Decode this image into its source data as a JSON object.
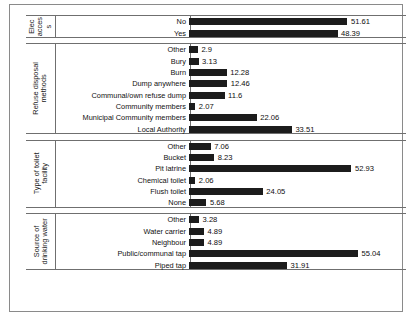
{
  "chart_data": {
    "type": "bar",
    "orientation": "horizontal",
    "title": "",
    "subtitle": "",
    "xlabel": "",
    "ylabel": "",
    "xlim": [
      0,
      60
    ],
    "grid": false,
    "legend": null,
    "value_labels": true,
    "bar_color": "#1c1c1c",
    "groups": [
      {
        "name": "Electricity access",
        "name_lines": [
          "Elec",
          "acces",
          "s"
        ],
        "categories": [
          "No",
          "Yes"
        ],
        "values": [
          51.61,
          48.39
        ],
        "labels": [
          "51.61",
          "48.39"
        ]
      },
      {
        "name": "Refuse disposal methods",
        "name_lines": [
          "Refuse disposal",
          "methods"
        ],
        "categories": [
          "Other",
          "Bury",
          "Burn",
          "Dump anywhere",
          "Communal/own refuse dump",
          "Community members",
          "Municipal Community members",
          "Local Authority"
        ],
        "values": [
          2.9,
          3.13,
          12.28,
          12.46,
          11.6,
          2.07,
          22.06,
          33.51
        ],
        "labels": [
          "2.9",
          "3.13",
          "12.28",
          "12.46",
          "11.6",
          "2.07",
          "22.06",
          "33.51"
        ]
      },
      {
        "name": "Type of toilet facility",
        "name_lines": [
          "Type of toilet",
          "facility"
        ],
        "categories": [
          "Other",
          "Bucket",
          "Pit latrine",
          "Chemical toilet",
          "Flush toilet",
          "None"
        ],
        "values": [
          7.06,
          8.23,
          52.93,
          2.06,
          24.05,
          5.68
        ],
        "labels": [
          "7.06",
          "8.23",
          "52.93",
          "2.06",
          "24.05",
          "5.68"
        ]
      },
      {
        "name": "Source of drinking water",
        "name_lines": [
          "Source of",
          "drinking water"
        ],
        "categories": [
          "Other",
          "Water carrier",
          "Neighbour",
          "Public/communal tap",
          "Piped tap"
        ],
        "values": [
          3.28,
          4.89,
          4.89,
          55.04,
          31.91
        ],
        "labels": [
          "3.28",
          "4.89",
          "4.89",
          "55.04",
          "31.91"
        ]
      }
    ]
  }
}
